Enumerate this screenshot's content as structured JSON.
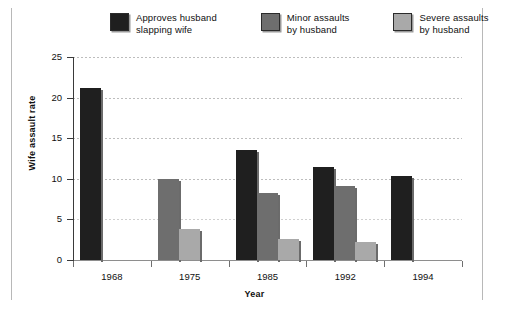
{
  "chart_data": {
    "type": "bar",
    "title": "",
    "xlabel": "Year",
    "ylabel": "Wife assault rate",
    "categories": [
      "1968",
      "1975",
      "1985",
      "1992",
      "1994"
    ],
    "ylim": [
      0,
      25
    ],
    "yticks": [
      0,
      5,
      10,
      15,
      20,
      25
    ],
    "grid": true,
    "legend_position": "top",
    "series": [
      {
        "name": "Approves husband slapping wife",
        "color": "#1f1f1f",
        "values": [
          21.2,
          null,
          13.5,
          11.4,
          10.3
        ]
      },
      {
        "name": "Minor assaults by husband",
        "color": "#6e6e6e",
        "values": [
          null,
          10.0,
          8.2,
          9.1,
          null
        ]
      },
      {
        "name": "Severe assaults by husband",
        "color": "#a9a9a9",
        "values": [
          null,
          3.8,
          2.6,
          2.2,
          null
        ]
      }
    ]
  },
  "legend": {
    "items": [
      {
        "label": "Approves husband\nslapping wife",
        "color": "#1f1f1f",
        "swatch_name": "legend-swatch-approves"
      },
      {
        "label": "Minor assaults\nby husband",
        "color": "#6e6e6e",
        "swatch_name": "legend-swatch-minor"
      },
      {
        "label": "Severe assaults\nby husband",
        "color": "#a9a9a9",
        "swatch_name": "legend-swatch-severe"
      }
    ]
  },
  "axes": {
    "y_title": "Wife assault rate",
    "x_title": "Year",
    "y_tick_labels": [
      "0",
      "5",
      "10",
      "15",
      "20",
      "25"
    ],
    "x_tick_labels": [
      "1968",
      "1975",
      "1985",
      "1992",
      "1994"
    ]
  }
}
